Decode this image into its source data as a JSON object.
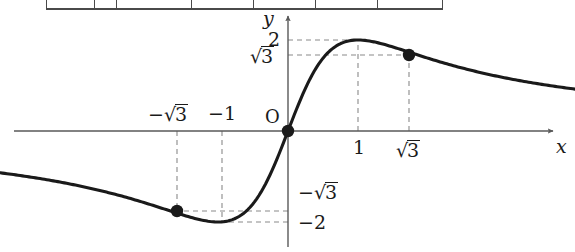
{
  "figure": {
    "kind": "cartesian-graph",
    "axes": {
      "x_axis_label": "x",
      "y_axis_label": "y",
      "origin_label": "O"
    },
    "x_ticks": [
      {
        "label_prefix": "−",
        "label_radicand": "3",
        "kind": "radical",
        "text": "−√3",
        "value": -1.732,
        "position": "above-axis"
      },
      {
        "text": "−1",
        "kind": "plain",
        "value": -1,
        "position": "above-axis"
      },
      {
        "text": "1",
        "kind": "plain",
        "value": 1,
        "position": "below-axis"
      },
      {
        "label_radicand": "3",
        "kind": "radical",
        "text": "√3",
        "value": 1.732,
        "position": "below-axis"
      }
    ],
    "y_ticks": [
      {
        "text": "2",
        "kind": "plain",
        "value": 2,
        "position": "left-of-axis"
      },
      {
        "label_radicand": "3",
        "kind": "radical",
        "text": "√3",
        "value": 1.732,
        "position": "left-of-axis"
      },
      {
        "label_prefix": "−",
        "label_radicand": "3",
        "kind": "radical",
        "text": "−√3",
        "value": -1.732,
        "position": "right-of-axis"
      },
      {
        "text": "−2",
        "kind": "plain",
        "value": -2,
        "position": "right-of-axis"
      }
    ],
    "marked_points": [
      {
        "name": "origin-point",
        "x": 0,
        "y": 0
      },
      {
        "name": "point-neg-sqrt3",
        "x": -1.732,
        "y": -1.732
      },
      {
        "name": "point-pos-sqrt3",
        "x": 1.732,
        "y": 1.732
      }
    ],
    "extrema": [
      {
        "name": "maximum",
        "x": 1,
        "y": 2
      },
      {
        "name": "minimum",
        "x": -1,
        "y": -2
      }
    ],
    "colors": {
      "curve": "#1a1a1a",
      "axis": "#595959",
      "dashed_guide": "#8a8a8a",
      "table_border": "#4a4a4a"
    }
  },
  "chart_data": {
    "type": "line",
    "title": "",
    "xlabel": "x",
    "ylabel": "y",
    "grid": false,
    "legend": "none",
    "function": "y = 4x/(x^2+1)",
    "xlim": [
      -4.11,
      4.1
    ],
    "ylim": [
      -2.66,
      2.57
    ],
    "x": [
      -4.11,
      -3.8,
      -3.5,
      -3.2,
      -2.9,
      -2.6,
      -2.3,
      -2.0,
      -1.732,
      -1.5,
      -1.25,
      -1.0,
      -0.8,
      -0.6,
      -0.4,
      -0.2,
      0,
      0.2,
      0.4,
      0.6,
      0.8,
      1.0,
      1.25,
      1.5,
      1.732,
      2.0,
      2.3,
      2.6,
      2.9,
      3.2,
      3.5,
      3.8,
      4.1
    ],
    "y": [
      -0.93,
      -1.0,
      -1.08,
      -1.16,
      -1.26,
      -1.36,
      -1.45,
      -1.6,
      -1.73,
      -1.85,
      -1.95,
      -2.0,
      -1.95,
      -1.76,
      -1.38,
      -0.77,
      0,
      0.77,
      1.38,
      1.76,
      1.95,
      2.0,
      1.95,
      1.85,
      1.73,
      1.6,
      1.45,
      1.36,
      1.26,
      1.16,
      1.08,
      1.0,
      0.93
    ],
    "annotated_points": [
      {
        "x": 0,
        "y": 0,
        "marker": "filled-circle"
      },
      {
        "x": -1.732,
        "y": -1.732,
        "marker": "filled-circle"
      },
      {
        "x": 1.732,
        "y": 1.732,
        "marker": "filled-circle"
      }
    ],
    "guide_lines": [
      {
        "from": [
          1,
          0
        ],
        "to": [
          1,
          2
        ],
        "style": "dashed"
      },
      {
        "from": [
          0,
          2
        ],
        "to": [
          1,
          2
        ],
        "style": "dashed"
      },
      {
        "from": [
          1.732,
          0
        ],
        "to": [
          1.732,
          1.732
        ],
        "style": "dashed"
      },
      {
        "from": [
          0,
          1.732
        ],
        "to": [
          1.732,
          1.732
        ],
        "style": "dashed"
      },
      {
        "from": [
          -1,
          0
        ],
        "to": [
          -1,
          -2
        ],
        "style": "dashed"
      },
      {
        "from": [
          0,
          -2
        ],
        "to": [
          -1,
          -2
        ],
        "style": "dashed"
      },
      {
        "from": [
          -1.732,
          0
        ],
        "to": [
          -1.732,
          -1.732
        ],
        "style": "dashed"
      },
      {
        "from": [
          0,
          -1.732
        ],
        "to": [
          -1.732,
          -1.732
        ],
        "style": "dashed"
      }
    ]
  },
  "table_strip": {
    "visible": true,
    "cell_widths": [
      48,
      22,
      75,
      62,
      62,
      62,
      62
    ]
  }
}
